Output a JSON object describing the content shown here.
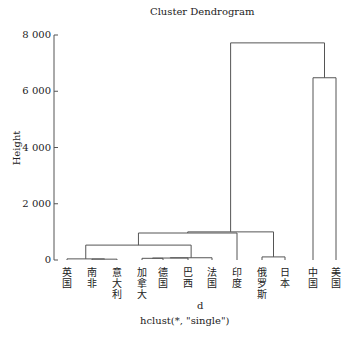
{
  "chart_data": {
    "type": "dendrogram",
    "xlabel": "d",
    "sublabel": "hclust(*, \"single\")",
    "ylabel": "Height",
    "ylim": [
      0,
      8000
    ],
    "yticks": [
      0,
      2000,
      4000,
      6000,
      8000
    ],
    "ytick_labels": [
      "0",
      "2 000",
      "4 000",
      "6 000",
      "8 000"
    ],
    "leaves": [
      "英国",
      "南非",
      "意大利",
      "加拿大",
      "德国",
      "巴西",
      "法国",
      "印度",
      "俄罗斯",
      "日本",
      "中国",
      "美国"
    ],
    "merges": [
      {
        "left": [
          "南非"
        ],
        "right": [
          "意大利"
        ],
        "height": 30
      },
      {
        "left": [
          "英国"
        ],
        "right": [
          "南非",
          "意大利"
        ],
        "height": 40
      },
      {
        "left": [
          "加拿大"
        ],
        "right": [
          "德国"
        ],
        "height": 60
      },
      {
        "left": [
          "加拿大",
          "德国"
        ],
        "right": [
          "巴西"
        ],
        "height": 70
      },
      {
        "left": [
          "加拿大",
          "德国",
          "巴西"
        ],
        "right": [
          "法国"
        ],
        "height": 80
      },
      {
        "left": [
          "俄罗斯"
        ],
        "right": [
          "日本"
        ],
        "height": 110
      },
      {
        "left": [
          "英国",
          "南非",
          "意大利"
        ],
        "right": [
          "加拿大",
          "德国",
          "巴西",
          "法国"
        ],
        "height": 530
      },
      {
        "left": [
          "英国",
          "南非",
          "意大利",
          "加拿大",
          "德国",
          "巴西",
          "法国"
        ],
        "right": [
          "印度"
        ],
        "height": 960
      },
      {
        "left": [
          "英国",
          "南非",
          "意大利",
          "加拿大",
          "德国",
          "巴西",
          "法国",
          "印度"
        ],
        "right": [
          "俄罗斯",
          "日本"
        ],
        "height": 1000
      },
      {
        "left": [
          "中国"
        ],
        "right": [
          "美国"
        ],
        "height": 6480
      },
      {
        "left": [
          "英国",
          "南非",
          "意大利",
          "加拿大",
          "德国",
          "巴西",
          "法国",
          "印度",
          "俄罗斯",
          "日本"
        ],
        "right": [
          "中国",
          "美国"
        ],
        "height": 7720
      }
    ]
  },
  "labels": {
    "ylabel": "Height",
    "xlabel": "d",
    "sublabel": "hclust(*, \"single\")"
  }
}
